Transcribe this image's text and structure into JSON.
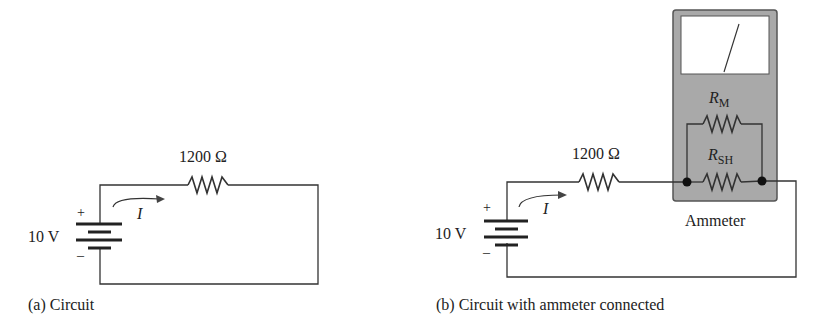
{
  "figure_a": {
    "caption": "(a) Circuit",
    "source_voltage": "10 V",
    "plus": "+",
    "minus": "–",
    "resistor_label": "1200 Ω",
    "current_label": "I"
  },
  "figure_b": {
    "caption": "(b) Circuit with ammeter connected",
    "source_voltage": "10 V",
    "plus": "+",
    "minus": "–",
    "resistor_label": "1200 Ω",
    "current_label": "I",
    "meter_resistor": "R",
    "meter_resistor_sub": "M",
    "shunt_resistor": "R",
    "shunt_resistor_sub": "SH",
    "instrument_label": "Ammeter"
  },
  "colors": {
    "meter_body": "#a9a9a9",
    "wire": "#333333"
  }
}
